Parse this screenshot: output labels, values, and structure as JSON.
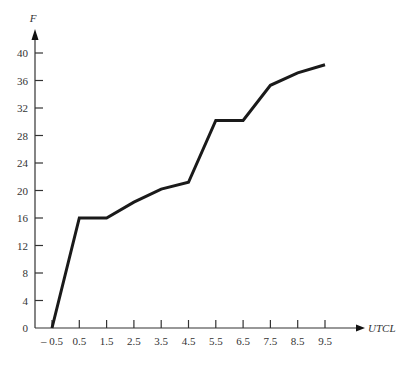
{
  "chart_data": {
    "type": "line",
    "title": "",
    "xlabel": "UTCL",
    "ylabel": "F",
    "x": [
      -0.5,
      0.5,
      1.5,
      2.5,
      3.5,
      4.5,
      5.5,
      6.5,
      7.5,
      8.5,
      9.5
    ],
    "series": [
      {
        "name": "F",
        "values": [
          0,
          16,
          16,
          18.3,
          20.2,
          21.2,
          30.2,
          30.2,
          35.3,
          37.1,
          38.3
        ]
      }
    ],
    "x_ticks": [
      -0.5,
      0.5,
      1.5,
      2.5,
      3.5,
      4.5,
      5.5,
      6.5,
      7.5,
      8.5,
      9.5
    ],
    "x_tick_labels": [
      "– 0.5",
      "0.5",
      "1.5",
      "2.5",
      "3.5",
      "4.5",
      "5.5",
      "6.5",
      "7.5",
      "8.5",
      "9.5"
    ],
    "y_ticks": [
      0,
      4,
      8,
      12,
      16,
      20,
      24,
      28,
      32,
      36,
      40
    ],
    "y_tick_labels": [
      "0",
      "4",
      "8",
      "12",
      "16",
      "20",
      "24",
      "28",
      "32",
      "36",
      "40"
    ],
    "xlim": [
      -1.1,
      10.5
    ],
    "ylim": [
      0,
      42
    ],
    "grid": false,
    "legend": null
  },
  "style": {
    "line_color": "#1a1a1a",
    "axis_color": "#333333"
  }
}
